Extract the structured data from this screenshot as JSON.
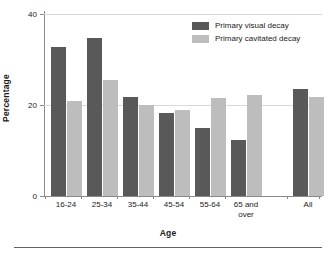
{
  "chart_data": {
    "type": "bar",
    "title": "",
    "xlabel": "Age",
    "ylabel": "Percentage",
    "ylim": [
      0,
      40
    ],
    "yticks": [
      0,
      20,
      40
    ],
    "ytick_labels": [
      "0",
      "20",
      "40"
    ],
    "grid": "horizontal-faint",
    "legend_position": "top-right",
    "categories": [
      "16-24",
      "25-34",
      "35-44",
      "45-54",
      "55-64",
      "65 and\nover",
      "All"
    ],
    "category_labels": [
      "16-24",
      "25-34",
      "35-44",
      "45-54",
      "55-64",
      "65 and over",
      "All"
    ],
    "series": [
      {
        "name": "Primary visual decay",
        "color": "#595959",
        "values": [
          32.7,
          34.7,
          21.8,
          18.2,
          14.9,
          12.3,
          23.5
        ]
      },
      {
        "name": "Primary cavitated decay",
        "color": "#bdbdbd",
        "values": [
          20.9,
          25.5,
          20.0,
          18.9,
          21.5,
          22.2,
          21.8
        ]
      }
    ]
  },
  "axes": {
    "y_title": "Percentage",
    "x_title": "Age",
    "y_tick_0": "0",
    "y_tick_1": "20",
    "y_tick_2": "40"
  },
  "legend": {
    "items": [
      {
        "label": "Primary visual decay",
        "color": "#595959"
      },
      {
        "label": "Primary cavitated decay",
        "color": "#bdbdbd"
      }
    ]
  },
  "categories": [
    {
      "line1": "16-24",
      "line2": ""
    },
    {
      "line1": "25-34",
      "line2": ""
    },
    {
      "line1": "35-44",
      "line2": ""
    },
    {
      "line1": "45-54",
      "line2": ""
    },
    {
      "line1": "55-64",
      "line2": ""
    },
    {
      "line1": "65 and",
      "line2": "over"
    },
    {
      "line1": "All",
      "line2": ""
    }
  ],
  "colors": {
    "visual": "#595959",
    "cavitated": "#bdbdbd",
    "axis": "#8a8a8a",
    "grid": "#d9d9d9",
    "rule": "#5a6470"
  }
}
